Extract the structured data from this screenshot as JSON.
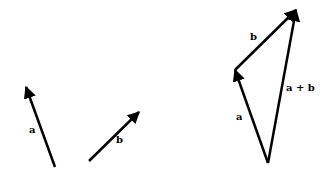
{
  "diagram": {
    "color": "#000000",
    "left": {
      "vector_a": {
        "label": "a",
        "tail": [
          55,
          167
        ],
        "head": [
          26,
          87
        ],
        "label_pos": [
          29,
          133
        ]
      },
      "vector_b": {
        "label": "b",
        "tail": [
          89,
          161
        ],
        "head": [
          139,
          112
        ],
        "label_pos": [
          116,
          143
        ]
      }
    },
    "right": {
      "vector_a": {
        "label": "a",
        "tail": [
          268,
          163
        ],
        "head": [
          235,
          70
        ],
        "label_pos": [
          236,
          120
        ]
      },
      "vector_b": {
        "label": "b",
        "tail": [
          235,
          70
        ],
        "head": [
          296,
          10
        ],
        "label_pos": [
          250,
          40
        ]
      },
      "vector_sum": {
        "label": "a + b",
        "tail": [
          268,
          163
        ],
        "head": [
          296,
          10
        ],
        "label_pos": [
          286,
          91
        ]
      }
    }
  }
}
